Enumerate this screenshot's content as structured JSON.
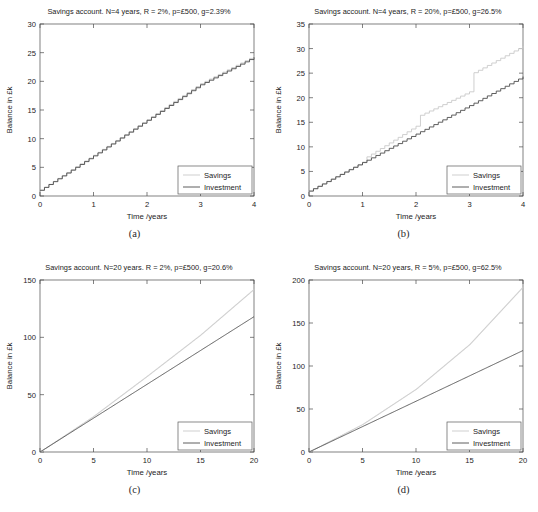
{
  "figure": {
    "axis_label_x": "Time /years",
    "axis_label_y": "Balance in £k",
    "legend": {
      "savings": "Savings",
      "investment": "Investment"
    },
    "colors": {
      "savings": "#c9c9c9",
      "investment": "#4d4d4d",
      "frame": "#4a4a4a",
      "background": "#ffffff"
    }
  },
  "chart_data": [
    {
      "type": "line",
      "panel": "a",
      "caption": "(a)",
      "title": "Savings account. N=4 years, R = 2%, p=£500, g=2.39%",
      "xlabel": "Time /years",
      "ylabel": "Balance in £k",
      "xlim": [
        0,
        4
      ],
      "ylim": [
        0,
        30
      ],
      "xticks": [
        0,
        1,
        2,
        3,
        4
      ],
      "yticks": [
        0,
        5,
        10,
        15,
        20,
        25,
        30
      ],
      "grid": false,
      "legend_position": "lower-right",
      "params": {
        "N_years": 4,
        "R_percent": 2,
        "p_pounds": 500,
        "g_percent": 2.39
      },
      "series": [
        {
          "name": "Savings",
          "step": "monthly",
          "x": [
            0,
            0.5,
            1,
            1.5,
            2,
            2.5,
            3,
            3.5,
            4
          ],
          "values": [
            1.0,
            4.1,
            7.1,
            10.2,
            13.3,
            16.5,
            19.6,
            22.0,
            24.4
          ]
        },
        {
          "name": "Investment",
          "step": "monthly",
          "x": [
            0,
            0.5,
            1,
            1.5,
            2,
            2.5,
            3,
            3.5,
            4
          ],
          "values": [
            1.0,
            4.0,
            7.0,
            10.1,
            13.2,
            16.3,
            19.4,
            21.8,
            24.2
          ]
        }
      ]
    },
    {
      "type": "line",
      "panel": "b",
      "caption": "(b)",
      "title": "Savings account. N=4 years, R = 20%, p=£500, g=26.5%",
      "xlabel": "Time /years",
      "ylabel": "Balance in £k",
      "xlim": [
        0,
        4
      ],
      "ylim": [
        0,
        35
      ],
      "xticks": [
        0,
        1,
        2,
        3,
        4
      ],
      "yticks": [
        0,
        5,
        10,
        15,
        20,
        25,
        30,
        35
      ],
      "grid": false,
      "legend_position": "lower-right",
      "params": {
        "N_years": 4,
        "R_percent": 20,
        "p_pounds": 500,
        "g_percent": 26.5
      },
      "series": [
        {
          "name": "Savings",
          "step": "monthly-with-annual-jumps",
          "x": [
            0,
            1,
            1.0001,
            2,
            2.0001,
            3,
            3.0001,
            4
          ],
          "values": [
            1.0,
            6.9,
            7.4,
            14.2,
            16.0,
            21.2,
            24.6,
            30.5
          ]
        },
        {
          "name": "Investment",
          "step": "monthly",
          "x": [
            0,
            1,
            2,
            3,
            4
          ],
          "values": [
            1.0,
            6.8,
            12.6,
            18.4,
            24.3
          ]
        }
      ]
    },
    {
      "type": "line",
      "panel": "c",
      "caption": "(c)",
      "title": "Savings account. N=20 years. R = 2%, p=£500, g=20.6%",
      "xlabel": "Time /years",
      "ylabel": "Balance in £k",
      "xlim": [
        0,
        20
      ],
      "ylim": [
        0,
        150
      ],
      "xticks": [
        0,
        5,
        10,
        15,
        20
      ],
      "yticks": [
        0,
        50,
        100,
        150
      ],
      "grid": false,
      "legend_position": "lower-right",
      "params": {
        "N_years": 20,
        "R_percent": 2,
        "p_pounds": 500,
        "g_percent": 20.6
      },
      "series": [
        {
          "name": "Savings",
          "step": "annual",
          "x": [
            0,
            5,
            10,
            15,
            20
          ],
          "values": [
            0,
            31,
            66,
            102,
            142
          ]
        },
        {
          "name": "Investment",
          "step": "linear",
          "x": [
            0,
            5,
            10,
            15,
            20
          ],
          "values": [
            0,
            29.5,
            59,
            88.5,
            118
          ]
        }
      ]
    },
    {
      "type": "line",
      "panel": "d",
      "caption": "(d)",
      "title": "Savings account. N=20 years, R = 5%, p=£500, g=62.5%",
      "xlabel": "Time /years",
      "ylabel": "Balance in £k",
      "xlim": [
        0,
        20
      ],
      "ylim": [
        0,
        200
      ],
      "xticks": [
        0,
        5,
        10,
        15,
        20
      ],
      "yticks": [
        0,
        50,
        100,
        150,
        200
      ],
      "grid": false,
      "legend_position": "lower-right",
      "params": {
        "N_years": 20,
        "R_percent": 5,
        "p_pounds": 500,
        "g_percent": 62.5
      },
      "series": [
        {
          "name": "Savings",
          "step": "annual",
          "x": [
            0,
            5,
            10,
            15,
            20
          ],
          "values": [
            0,
            32,
            73,
            125,
            192
          ]
        },
        {
          "name": "Investment",
          "step": "linear",
          "x": [
            0,
            5,
            10,
            15,
            20
          ],
          "values": [
            0,
            29.5,
            59,
            88.5,
            118
          ]
        }
      ]
    }
  ]
}
